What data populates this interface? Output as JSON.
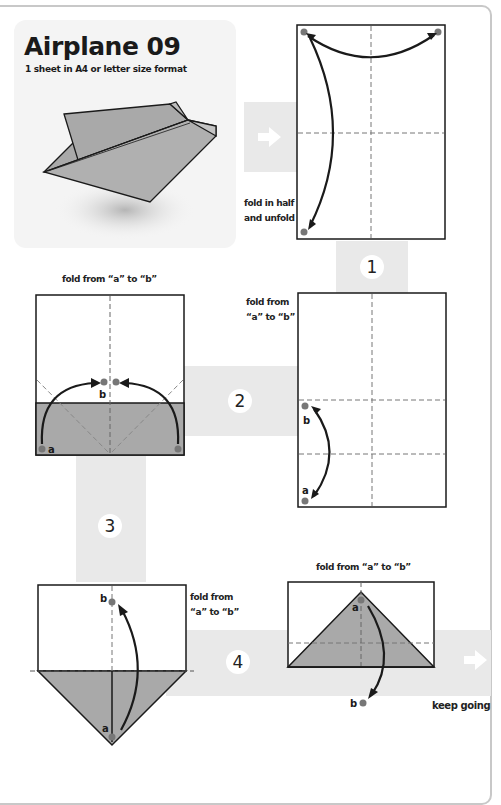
{
  "page": {
    "title": "Airplane 09",
    "subtitle": "1 sheet in A4 or letter size format"
  },
  "steps": [
    {
      "number": "1",
      "instruction_line1": "fold in half",
      "instruction_line2": "and unfold"
    },
    {
      "number": "2",
      "instruction_line1": "fold from",
      "instruction_line2": "“a” to “b”"
    },
    {
      "number": "3",
      "instruction": "fold from “a” to “b”"
    },
    {
      "number": "4",
      "instruction_line1": "fold from",
      "instruction_line2": "“a” to “b”"
    },
    {
      "number": "5",
      "instruction": "fold from “a” to “b”"
    }
  ],
  "point_labels": {
    "a": "a",
    "b": "b"
  },
  "footer": {
    "continue_label": "keep going"
  },
  "colors": {
    "paper": "#ffffff",
    "folded": "#a9a9a9",
    "band": "#e9e9e9",
    "dot": "#777777",
    "line": "#1a1a1a"
  }
}
